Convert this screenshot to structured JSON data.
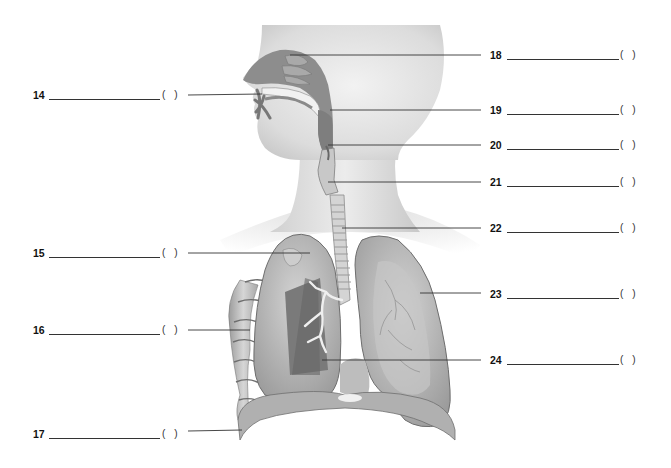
{
  "figure": {
    "illustration": "respiratory-system-illustration",
    "answer_bracket_open": "(",
    "answer_bracket_close": ")"
  },
  "labels_left": [
    {
      "number": "14",
      "y": 95,
      "answer": "",
      "bracket_answer": "",
      "points_to": "nasal-cavity-conchae"
    },
    {
      "number": "15",
      "y": 253,
      "answer": "",
      "bracket_answer": "",
      "points_to": "lung-apex-pleura"
    },
    {
      "number": "16",
      "y": 330,
      "answer": "",
      "bracket_answer": "",
      "points_to": "rib"
    },
    {
      "number": "17",
      "y": 434,
      "answer": "",
      "bracket_answer": "",
      "points_to": "diaphragm"
    }
  ],
  "labels_right": [
    {
      "number": "18",
      "y": 55,
      "answer": "",
      "bracket_answer": "",
      "points_to": "nasal-cavity"
    },
    {
      "number": "19",
      "y": 110,
      "answer": "",
      "bracket_answer": "",
      "points_to": "pharynx"
    },
    {
      "number": "20",
      "y": 145,
      "answer": "",
      "bracket_answer": "",
      "points_to": "epiglottis"
    },
    {
      "number": "21",
      "y": 182,
      "answer": "",
      "bracket_answer": "",
      "points_to": "larynx"
    },
    {
      "number": "22",
      "y": 228,
      "answer": "",
      "bracket_answer": "",
      "points_to": "trachea"
    },
    {
      "number": "23",
      "y": 294,
      "answer": "",
      "bracket_answer": "",
      "points_to": "left-lung"
    },
    {
      "number": "24",
      "y": 360,
      "answer": "",
      "bracket_answer": "",
      "points_to": "bronchus"
    }
  ],
  "colors": {
    "skin_light": "#e8e8e8",
    "skin_mid": "#cfcfcf",
    "airway_dark": "#8a8a8a",
    "lung": "#b9b9b9",
    "lung_dark": "#7d7d7d",
    "line": "#333333",
    "text": "#111111"
  }
}
